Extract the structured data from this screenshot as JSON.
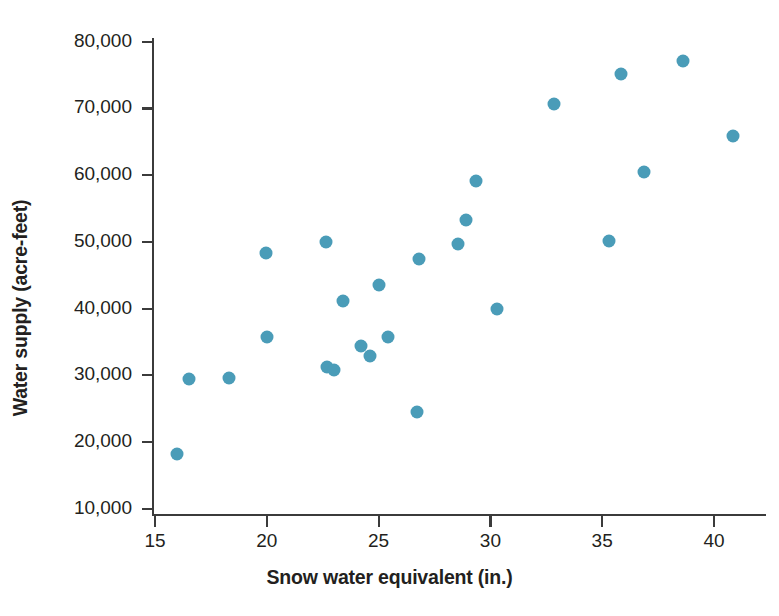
{
  "chart_data": {
    "type": "scatter",
    "title": "",
    "xlabel": "Snow water equivalent (in.)",
    "ylabel": "Water supply (acre-feet)",
    "xlim": [
      14.0,
      42.0
    ],
    "ylim": [
      9000,
      81500
    ],
    "xticks": [
      15,
      20,
      25,
      30,
      35,
      40
    ],
    "xtick_labels": [
      "15",
      "20",
      "25",
      "30",
      "35",
      "40"
    ],
    "yticks": [
      10000,
      20000,
      30000,
      40000,
      50000,
      60000,
      70000,
      80000
    ],
    "ytick_labels": [
      "10,000",
      "20,000",
      "30,000",
      "40,000",
      "50,000",
      "60,000",
      "70,000",
      "80,000"
    ],
    "grid": false,
    "legend": false,
    "marker_color": "#4a9cb8",
    "axis_color": "#3b3b3b",
    "background": "#ffffff",
    "points": [
      {
        "x": 16.0,
        "y": 18200
      },
      {
        "x": 16.5,
        "y": 29400
      },
      {
        "x": 18.3,
        "y": 29550
      },
      {
        "x": 19.95,
        "y": 48300
      },
      {
        "x": 20.0,
        "y": 35700
      },
      {
        "x": 22.65,
        "y": 49950
      },
      {
        "x": 22.7,
        "y": 31300
      },
      {
        "x": 23.0,
        "y": 30800
      },
      {
        "x": 23.4,
        "y": 41100
      },
      {
        "x": 24.2,
        "y": 34400
      },
      {
        "x": 24.6,
        "y": 32900
      },
      {
        "x": 25.0,
        "y": 43500
      },
      {
        "x": 25.4,
        "y": 35800
      },
      {
        "x": 26.7,
        "y": 24500
      },
      {
        "x": 26.8,
        "y": 47400
      },
      {
        "x": 28.55,
        "y": 49700
      },
      {
        "x": 28.9,
        "y": 53300
      },
      {
        "x": 29.35,
        "y": 59100
      },
      {
        "x": 30.3,
        "y": 39900
      },
      {
        "x": 32.85,
        "y": 70650
      },
      {
        "x": 35.3,
        "y": 50100
      },
      {
        "x": 35.85,
        "y": 75150
      },
      {
        "x": 36.85,
        "y": 60400
      },
      {
        "x": 38.6,
        "y": 77100
      },
      {
        "x": 40.85,
        "y": 65800
      }
    ]
  }
}
